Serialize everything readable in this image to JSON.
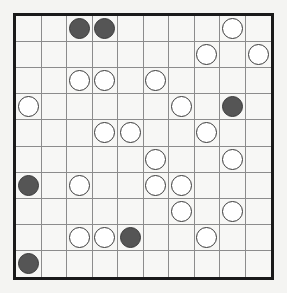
{
  "puzzle": {
    "type": "masyu",
    "rows": 10,
    "cols": 10,
    "colors": {
      "white_pearl": "#ffffff",
      "black_pearl": "#555555",
      "grid_line": "#8c8c8c",
      "border": "#1a1a1a"
    },
    "pearls": [
      {
        "row": 0,
        "col": 2,
        "color": "black"
      },
      {
        "row": 0,
        "col": 3,
        "color": "black"
      },
      {
        "row": 0,
        "col": 8,
        "color": "white"
      },
      {
        "row": 1,
        "col": 7,
        "color": "white"
      },
      {
        "row": 1,
        "col": 9,
        "color": "white"
      },
      {
        "row": 2,
        "col": 2,
        "color": "white"
      },
      {
        "row": 2,
        "col": 3,
        "color": "white"
      },
      {
        "row": 2,
        "col": 5,
        "color": "white"
      },
      {
        "row": 3,
        "col": 0,
        "color": "white"
      },
      {
        "row": 3,
        "col": 6,
        "color": "white"
      },
      {
        "row": 3,
        "col": 8,
        "color": "black"
      },
      {
        "row": 4,
        "col": 3,
        "color": "white"
      },
      {
        "row": 4,
        "col": 4,
        "color": "white"
      },
      {
        "row": 4,
        "col": 7,
        "color": "white"
      },
      {
        "row": 5,
        "col": 5,
        "color": "white"
      },
      {
        "row": 5,
        "col": 8,
        "color": "white"
      },
      {
        "row": 6,
        "col": 0,
        "color": "black"
      },
      {
        "row": 6,
        "col": 2,
        "color": "white"
      },
      {
        "row": 6,
        "col": 5,
        "color": "white"
      },
      {
        "row": 6,
        "col": 6,
        "color": "white"
      },
      {
        "row": 7,
        "col": 6,
        "color": "white"
      },
      {
        "row": 7,
        "col": 8,
        "color": "white"
      },
      {
        "row": 8,
        "col": 2,
        "color": "white"
      },
      {
        "row": 8,
        "col": 3,
        "color": "white"
      },
      {
        "row": 8,
        "col": 4,
        "color": "black"
      },
      {
        "row": 8,
        "col": 7,
        "color": "white"
      },
      {
        "row": 9,
        "col": 0,
        "color": "black"
      }
    ]
  }
}
